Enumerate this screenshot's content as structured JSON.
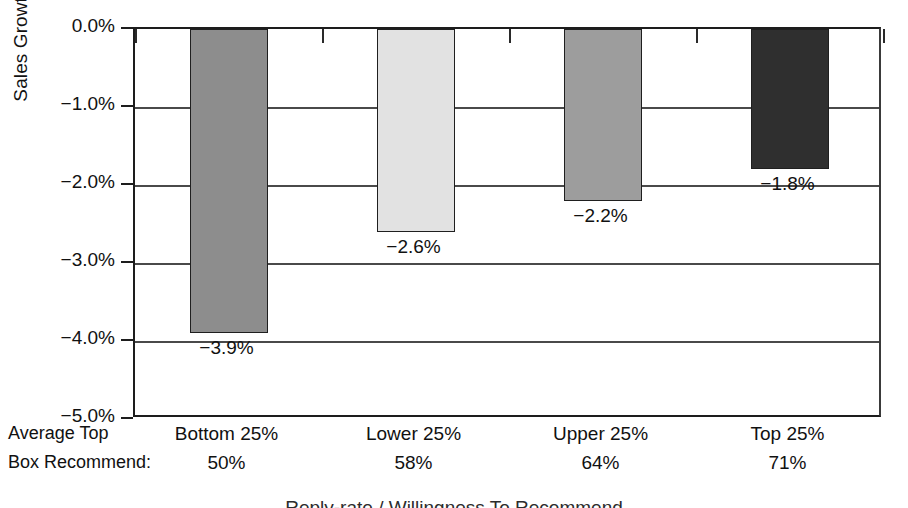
{
  "chart_data": {
    "type": "bar",
    "title": "Reply-rate / Willingness To Recommend",
    "xlabel": "",
    "ylabel": "Sales Growth",
    "categories": [
      "Bottom 25%",
      "Lower 25%",
      "Upper 25%",
      "Top 25%"
    ],
    "values": [
      -3.9,
      -2.6,
      -2.2,
      -1.8
    ],
    "value_labels": [
      "−3.9%",
      "−2.6%",
      "−2.2%",
      "−1.8%"
    ],
    "bar_colors": [
      "#8d8d8d",
      "#e2e2e2",
      "#9d9d9d",
      "#2f2f2f"
    ],
    "ylim": [
      -5.0,
      0.0
    ],
    "ytick_values": [
      0.0,
      -1.0,
      -2.0,
      -3.0,
      -4.0,
      -5.0
    ],
    "ytick_labels": [
      "0.0%",
      "−1.0%",
      "−2.0%",
      "−3.0%",
      "−4.0%",
      "−5.0%"
    ],
    "grid": true,
    "legend": "none",
    "secondary_row": {
      "header_line1": "Average Top",
      "header_line2": "Box Recommend:",
      "values": [
        "50%",
        "58%",
        "64%",
        "71%"
      ]
    }
  },
  "axis": {
    "y_title": "Sales Growth"
  },
  "caption": {
    "text": "Reply-rate / Willingness To Recommend"
  }
}
